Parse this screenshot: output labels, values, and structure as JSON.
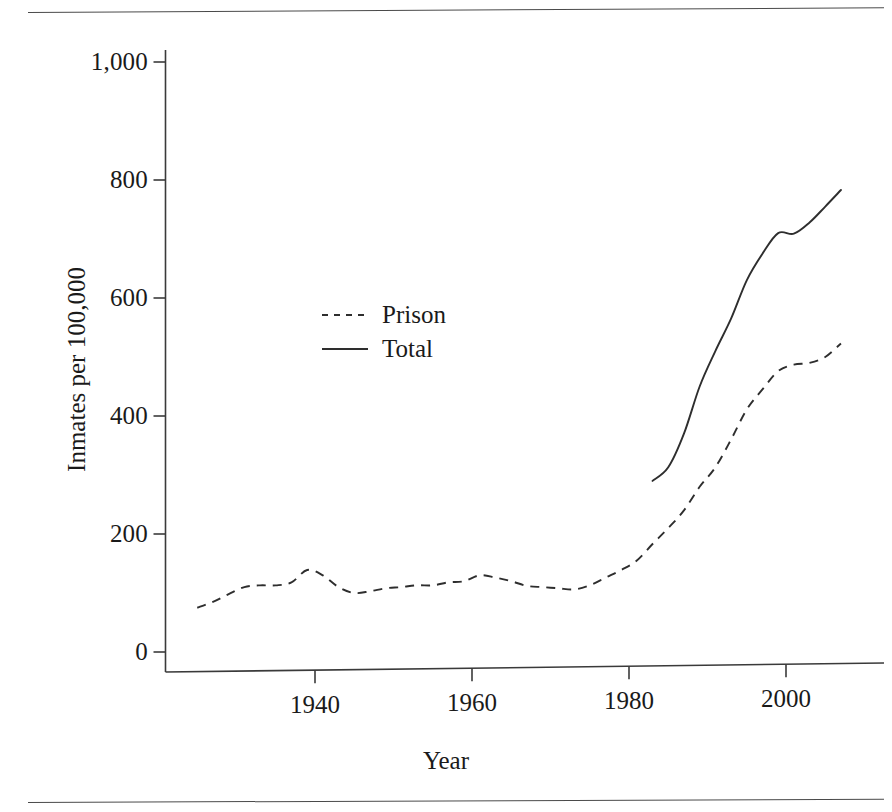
{
  "figure": {
    "rules": [
      "top-rule",
      "bottom-rule"
    ]
  },
  "axes": {
    "y_title": "Inmates per 100,000",
    "x_title": "Year",
    "y_ticks": [
      "0",
      "200",
      "400",
      "600",
      "800",
      "1,000"
    ],
    "x_ticks": [
      "1940",
      "1960",
      "1980",
      "2000"
    ]
  },
  "legend": {
    "items": [
      {
        "label": "Prison",
        "style": "dashed"
      },
      {
        "label": "Total",
        "style": "solid"
      }
    ]
  },
  "colors": {
    "ink": "#2e2e2e",
    "axis": "#3a3a3a",
    "background": "#ffffff"
  },
  "chart_data": {
    "type": "line",
    "title": "",
    "xlabel": "Year",
    "ylabel": "Inmates per 100,000",
    "xlim": [
      1923,
      2009
    ],
    "ylim": [
      0,
      1000
    ],
    "yticks": [
      0,
      200,
      400,
      600,
      800,
      1000
    ],
    "xticks": [
      1940,
      1960,
      1980,
      2000
    ],
    "grid": false,
    "legend_position": "upper-left-inside",
    "series": [
      {
        "name": "Prison",
        "style": "dashed",
        "x": [
          1925,
          1927,
          1929,
          1931,
          1933,
          1935,
          1937,
          1939,
          1941,
          1943,
          1945,
          1947,
          1949,
          1951,
          1953,
          1955,
          1957,
          1959,
          1961,
          1963,
          1965,
          1967,
          1969,
          1971,
          1973,
          1975,
          1977,
          1979,
          1981,
          1983,
          1985,
          1987,
          1989,
          1991,
          1993,
          1995,
          1997,
          1999,
          2001,
          2003,
          2005,
          2007
        ],
        "y": [
          75,
          85,
          98,
          110,
          113,
          113,
          118,
          139,
          130,
          110,
          100,
          103,
          108,
          110,
          113,
          113,
          118,
          120,
          130,
          126,
          120,
          112,
          110,
          108,
          106,
          113,
          126,
          139,
          155,
          183,
          210,
          240,
          280,
          313,
          360,
          411,
          445,
          476,
          487,
          490,
          500,
          523
        ]
      },
      {
        "name": "Total",
        "style": "solid",
        "x": [
          1983,
          1985,
          1987,
          1989,
          1991,
          1993,
          1995,
          1997,
          1999,
          2001,
          2003,
          2005,
          2007
        ],
        "y": [
          290,
          313,
          370,
          450,
          510,
          565,
          630,
          675,
          710,
          709,
          728,
          755,
          783
        ]
      }
    ]
  }
}
